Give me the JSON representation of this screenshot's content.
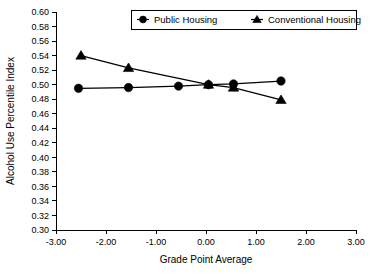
{
  "chart_data": {
    "type": "line",
    "title": "",
    "xlabel": "Grade Point Average",
    "ylabel": "Alcohol Use Percentile Index",
    "xlim": [
      -3.0,
      3.0
    ],
    "ylim": [
      0.3,
      0.6
    ],
    "xticks": [
      "-3.00",
      "-2.00",
      "-1.00",
      "0.00",
      "1.00",
      "2.00",
      "3.00"
    ],
    "xtick_values": [
      -3.0,
      -2.0,
      -1.0,
      0.0,
      1.0,
      2.0,
      3.0
    ],
    "yticks": [
      "0.60",
      "0.58",
      "0.56",
      "0.54",
      "0.52",
      "0.50",
      "0.48",
      "0.46",
      "0.44",
      "0.42",
      "0.40",
      "0.38",
      "0.36",
      "0.34",
      "0.32",
      "0.30"
    ],
    "ytick_values": [
      0.6,
      0.58,
      0.56,
      0.54,
      0.52,
      0.5,
      0.48,
      0.46,
      0.44,
      0.42,
      0.4,
      0.38,
      0.36,
      0.34,
      0.32,
      0.3
    ],
    "grid": false,
    "legend_position": "top-center",
    "series": [
      {
        "name": "Public Housing",
        "marker": "circle",
        "x": [
          -2.55,
          -1.55,
          -0.55,
          0.05,
          0.55,
          1.5
        ],
        "values": [
          0.495,
          0.496,
          0.498,
          0.5,
          0.501,
          0.505
        ]
      },
      {
        "name": "Conventional Housing",
        "marker": "triangle",
        "x": [
          -2.5,
          -1.55,
          0.05,
          0.55,
          1.5
        ],
        "values": [
          0.54,
          0.523,
          0.5,
          0.496,
          0.479
        ]
      }
    ]
  },
  "legend": {
    "items": [
      {
        "label": "Public Housing",
        "marker": "circle"
      },
      {
        "label": "Conventional Housing",
        "marker": "triangle"
      }
    ]
  }
}
